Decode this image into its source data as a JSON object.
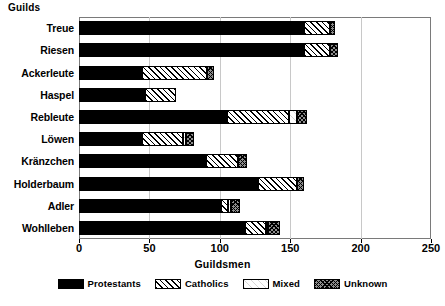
{
  "chart_data": {
    "type": "bar",
    "orientation": "horizontal",
    "stacked": true,
    "title": "",
    "xlabel": "Guildsmen",
    "ylabel": "Guilds",
    "xlim": [
      0,
      250
    ],
    "xticks": [
      0,
      50,
      100,
      150,
      200,
      250
    ],
    "xtick_labels": [
      "0",
      "50",
      "100",
      "150",
      "200",
      "250"
    ],
    "grid": "vertical",
    "legend_position": "bottom",
    "categories": [
      "Treue",
      "Riesen",
      "Ackerleute",
      "Haspel",
      "Rebleute",
      "Löwen",
      "Kränzchen",
      "Holderbaum",
      "Adler",
      "Wohlleben"
    ],
    "series": [
      {
        "name": "Protestants",
        "pattern": "solid-black",
        "color": "#000000",
        "values": [
          160,
          160,
          45,
          47,
          105,
          45,
          90,
          127,
          101,
          118
        ]
      },
      {
        "name": "Catholics",
        "pattern": "diagonal-hatch",
        "color": "#ffffff",
        "values": [
          18,
          18,
          46,
          22,
          44,
          29,
          23,
          28,
          5,
          15
        ]
      },
      {
        "name": "Mixed",
        "pattern": "light-dots",
        "color": "#ffffff",
        "values": [
          0,
          0,
          0,
          0,
          6,
          2,
          0,
          0,
          2,
          1
        ]
      },
      {
        "name": "Unknown",
        "pattern": "cross-hatch",
        "color": "#8d8d8d",
        "values": [
          4,
          6,
          5,
          0,
          7,
          6,
          6,
          5,
          6,
          9
        ]
      }
    ],
    "totals": [
      182,
      184,
      96,
      69,
      162,
      82,
      119,
      160,
      114,
      143
    ]
  },
  "legend": {
    "items": [
      {
        "label": "Protestants",
        "key": "protestants"
      },
      {
        "label": "Catholics",
        "key": "catholics"
      },
      {
        "label": "Mixed",
        "key": "mixed"
      },
      {
        "label": "Unknown",
        "key": "unknown"
      }
    ]
  }
}
